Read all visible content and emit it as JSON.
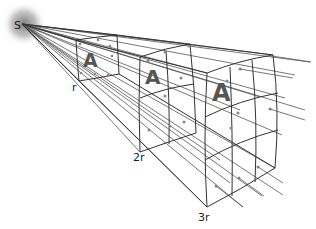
{
  "diagram": {
    "title": "",
    "source_label": "S",
    "distance_labels": [
      "r",
      "2r",
      "3r"
    ],
    "plate_letter": "A",
    "colors": {
      "line": "#333333",
      "ray": "#555555",
      "letter": "#555555",
      "glow": "#777777"
    }
  }
}
